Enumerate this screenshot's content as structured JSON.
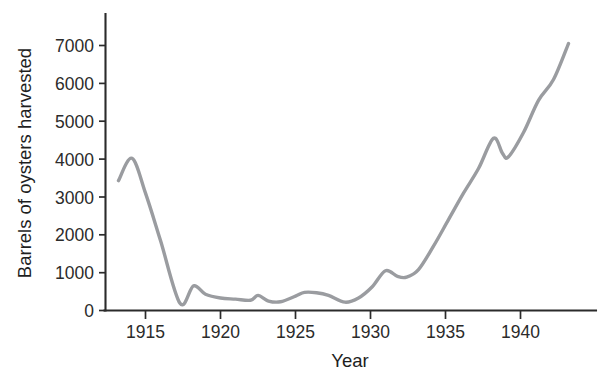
{
  "chart_data": {
    "type": "line",
    "title": "",
    "xlabel": "Year",
    "ylabel": "Barrels of oysters harvested",
    "xlim": [
      1913,
      1944
    ],
    "ylim": [
      0,
      7600
    ],
    "grid": false,
    "legend": null,
    "line_color": "#9a9ca0",
    "axis_color": "#2b2b2b",
    "xticks": [
      1915,
      1920,
      1925,
      1930,
      1935,
      1940
    ],
    "xtick_labels": [
      "1915",
      "1920",
      "1925",
      "1930",
      "1935",
      "1940"
    ],
    "yticks": [
      0,
      1000,
      2000,
      3000,
      4000,
      5000,
      6000,
      7000
    ],
    "ytick_labels": [
      "0",
      "1000",
      "2000",
      "3000",
      "4000",
      "5000",
      "6000",
      "7000"
    ],
    "series": [
      {
        "name": "Barrels of oysters harvested",
        "x": [
          1913.2,
          1914.1,
          1915.0,
          1916.0,
          1917.3,
          1918.2,
          1919.0,
          1920.0,
          1921.0,
          1922.0,
          1922.5,
          1923.2,
          1924.0,
          1925.0,
          1925.6,
          1926.4,
          1927.2,
          1928.3,
          1929.2,
          1930.1,
          1931.0,
          1931.8,
          1932.4,
          1933.2,
          1934.2,
          1935.2,
          1936.2,
          1937.2,
          1938.2,
          1938.8,
          1939.2,
          1940.2,
          1941.2,
          1942.2,
          1943.2
        ],
        "y": [
          3430,
          4020,
          3100,
          1850,
          190,
          650,
          430,
          330,
          300,
          270,
          400,
          250,
          230,
          380,
          480,
          470,
          400,
          220,
          330,
          620,
          1050,
          900,
          880,
          1080,
          1700,
          2400,
          3100,
          3750,
          4550,
          4150,
          4060,
          4700,
          5550,
          6100,
          7050
        ],
        "values_note": "Barrels of oysters harvested per year"
      }
    ]
  },
  "axes": {
    "y_title": "Barrels of oysters harvested",
    "x_title": "Year"
  }
}
